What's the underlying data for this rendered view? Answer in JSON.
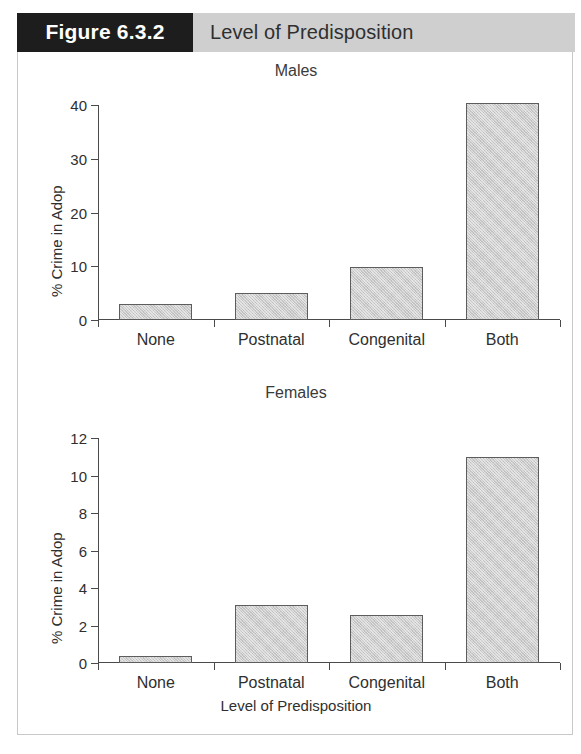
{
  "header": {
    "figure_number": "Figure 6.3.2",
    "figure_title": "Level of Predisposition"
  },
  "chart_data": {
    "type": "bar",
    "title": "Level of Predisposition",
    "xlabel": "Level of Predisposition",
    "ylabel": "% Crime in Adop",
    "categories": [
      "None",
      "Postnatal",
      "Congenital",
      "Both"
    ],
    "grid": false,
    "legend": "none",
    "panels": [
      {
        "title": "Males",
        "ylabel": "% Crime in Adop",
        "xlabel": "",
        "ylim": [
          0,
          40
        ],
        "yticks": [
          0,
          10,
          20,
          30,
          40
        ],
        "ytick_labels": [
          "0",
          "10",
          "20",
          "30",
          "40"
        ],
        "categories": [
          "None",
          "Postnatal",
          "Congenital",
          "Both"
        ],
        "values": [
          3.0,
          5.0,
          9.9,
          40.3
        ]
      },
      {
        "title": "Females",
        "ylabel": "% Crime in Adop",
        "xlabel": "Level of Predisposition",
        "ylim": [
          0,
          12
        ],
        "yticks": [
          0,
          2,
          4,
          6,
          8,
          10,
          12
        ],
        "ytick_labels": [
          "0",
          "2",
          "4",
          "6",
          "8",
          "10",
          "12"
        ],
        "categories": [
          "None",
          "Postnatal",
          "Congenital",
          "Both"
        ],
        "values": [
          0.4,
          3.1,
          2.55,
          11.0
        ]
      }
    ]
  },
  "colors": {
    "bar_fill": "#cdcdcd",
    "bar_stroke": "#5d5d5d",
    "header_band": "#cfcfcf",
    "header_block": "#1d1d1d",
    "axis": "#4a4a4a"
  }
}
